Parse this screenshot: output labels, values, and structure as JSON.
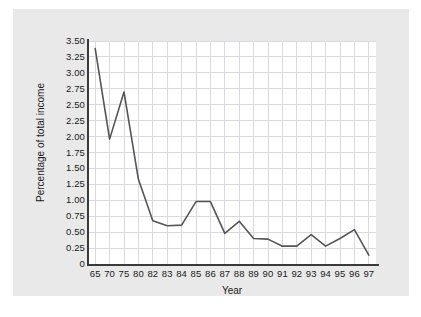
{
  "chart_data": {
    "type": "line",
    "title": "",
    "xlabel": "Year",
    "ylabel": "Percentage of total income",
    "grid": true,
    "legend": null,
    "ylim": [
      0,
      3.5
    ],
    "ytick_labels": [
      "3.50",
      "3.25",
      "3.00",
      "2.75",
      "2.50",
      "2.25",
      "2.00",
      "1.75",
      "1.50",
      "1.25",
      "1.00",
      "0.75",
      "0.50",
      "0.25",
      "0"
    ],
    "ytick_values": [
      3.5,
      3.25,
      3.0,
      2.75,
      2.5,
      2.25,
      2.0,
      1.75,
      1.5,
      1.25,
      1.0,
      0.75,
      0.5,
      0.25,
      0
    ],
    "categories": [
      "65",
      "70",
      "75",
      "80",
      "82",
      "83",
      "84",
      "85",
      "86",
      "87",
      "88",
      "89",
      "90",
      "91",
      "92",
      "93",
      "94",
      "95",
      "96",
      "97"
    ],
    "values": [
      3.38,
      1.96,
      2.7,
      1.33,
      0.68,
      0.6,
      0.61,
      0.98,
      0.98,
      0.48,
      0.67,
      0.4,
      0.39,
      0.28,
      0.28,
      0.46,
      0.28,
      0.4,
      0.54,
      0.14
    ],
    "series": [
      {
        "name": "Percentage of total income",
        "values": [
          3.38,
          1.96,
          2.7,
          1.33,
          0.68,
          0.6,
          0.61,
          0.98,
          0.98,
          0.48,
          0.67,
          0.4,
          0.39,
          0.28,
          0.28,
          0.46,
          0.28,
          0.4,
          0.54,
          0.14
        ]
      }
    ],
    "colors": {
      "line": "#555555",
      "grid": "#d9d9e4",
      "axis": "#3a3a3a",
      "plot_background": "#ffffff",
      "figure_background": "#e9e9e9",
      "text": "#1a1a1a"
    }
  }
}
